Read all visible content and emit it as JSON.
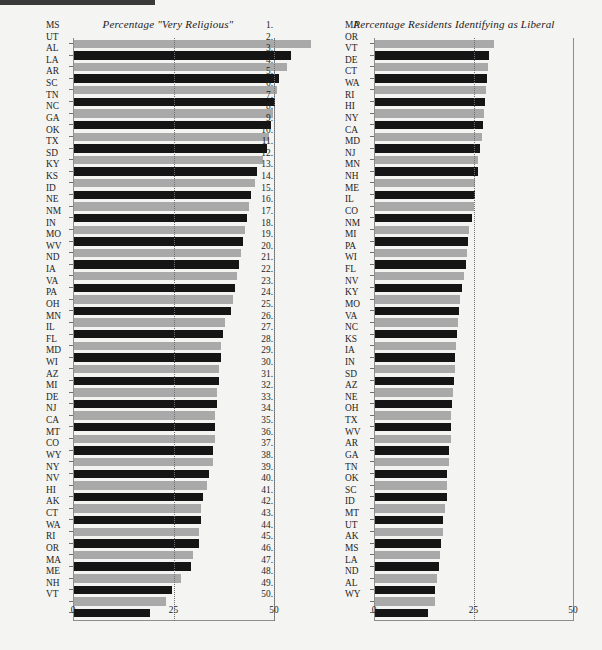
{
  "chart_data": [
    {
      "type": "bar",
      "orientation": "horizontal",
      "title": "Percentage \"Very Religious\"",
      "xlabel": "",
      "ylabel": "",
      "xlim": [
        0,
        50
      ],
      "xticks": [
        0,
        25,
        50
      ],
      "xtick_labels": [
        "0",
        "25",
        "50"
      ],
      "grid": true,
      "gridlines_at": [
        25,
        50
      ],
      "legend": "none",
      "bar_colors": {
        "odd_rank": "#a9a9a9",
        "even_rank": "#151515"
      },
      "categories": [
        "MS",
        "UT",
        "AL",
        "LA",
        "AR",
        "SC",
        "TN",
        "NC",
        "GA",
        "OK",
        "TX",
        "SD",
        "KY",
        "KS",
        "ID",
        "NE",
        "NM",
        "IN",
        "MO",
        "WV",
        "ND",
        "IA",
        "VA",
        "PA",
        "OH",
        "MN",
        "IL",
        "FL",
        "MD",
        "WI",
        "AZ",
        "MI",
        "DE",
        "NJ",
        "CA",
        "MT",
        "CO",
        "WY",
        "NY",
        "NV",
        "HI",
        "AK",
        "CT",
        "WA",
        "RI",
        "OR",
        "MA",
        "ME",
        "NH",
        "VT"
      ],
      "values": [
        59,
        54,
        53,
        51,
        50.5,
        50,
        49.5,
        49,
        48.5,
        48,
        47,
        45.5,
        45,
        44,
        43.5,
        43,
        42.5,
        42,
        41.5,
        41,
        40.5,
        40,
        39.5,
        39,
        37.5,
        37,
        36.5,
        36.5,
        36,
        36,
        35.5,
        35.5,
        35,
        35,
        35,
        34.5,
        34.5,
        33.5,
        33,
        32,
        31.5,
        31.5,
        31,
        31,
        29.5,
        29,
        26.5,
        24.5,
        23,
        19
      ],
      "ranks": [
        1,
        2,
        3,
        4,
        5,
        6,
        7,
        8,
        9,
        10,
        11,
        12,
        13,
        14,
        15,
        16,
        17,
        18,
        19,
        20,
        21,
        22,
        23,
        24,
        25,
        26,
        27,
        28,
        29,
        30,
        31,
        32,
        33,
        34,
        35,
        36,
        37,
        38,
        39,
        40,
        41,
        42,
        43,
        44,
        45,
        46,
        47,
        48,
        49,
        50
      ]
    },
    {
      "type": "bar",
      "orientation": "horizontal",
      "title": "Percentage Residents Identifying as Liberal",
      "xlabel": "",
      "ylabel": "",
      "xlim": [
        0,
        50
      ],
      "xticks": [
        0,
        25,
        50
      ],
      "xtick_labels": [
        "0",
        "25",
        "50"
      ],
      "grid": true,
      "gridlines_at": [
        25
      ],
      "legend": "none",
      "bar_colors": {
        "odd_rank": "#a9a9a9",
        "even_rank": "#151515"
      },
      "categories": [
        "MA",
        "OR",
        "VT",
        "DE",
        "CT",
        "WA",
        "RI",
        "HI",
        "NY",
        "CA",
        "MD",
        "NJ",
        "MN",
        "NH",
        "ME",
        "IL",
        "CO",
        "NM",
        "MI",
        "PA",
        "WI",
        "FL",
        "NV",
        "KY",
        "MO",
        "VA",
        "NC",
        "KS",
        "IA",
        "IN",
        "SD",
        "AZ",
        "NE",
        "OH",
        "TX",
        "WV",
        "AR",
        "GA",
        "TN",
        "OK",
        "SC",
        "ID",
        "MT",
        "UT",
        "AK",
        "MS",
        "LA",
        "ND",
        "AL",
        "WY"
      ],
      "values": [
        30,
        28.6,
        28.4,
        28.2,
        28,
        27.6,
        27.4,
        27.2,
        26.8,
        26.4,
        26,
        25.8,
        25.2,
        25,
        24.8,
        24.4,
        23.6,
        23.4,
        23,
        22.8,
        22.4,
        21.8,
        21.4,
        21.2,
        20.8,
        20.6,
        20.4,
        20.2,
        20,
        19.8,
        19.6,
        19.4,
        19.2,
        19.2,
        19,
        18.6,
        18.6,
        18.2,
        18.2,
        18,
        17.6,
        17.2,
        17.2,
        16.6,
        16.4,
        16,
        15.6,
        15.2,
        15,
        13.2
      ],
      "ranks": [
        1,
        2,
        3,
        4,
        5,
        6,
        7,
        8,
        9,
        10,
        11,
        12,
        13,
        14,
        15,
        16,
        17,
        18,
        19,
        20,
        21,
        22,
        23,
        24,
        25,
        26,
        27,
        28,
        29,
        30,
        31,
        32,
        33,
        34,
        35,
        36,
        37,
        38,
        39,
        40,
        41,
        42,
        43,
        44,
        45,
        46,
        47,
        48,
        49,
        50
      ]
    }
  ]
}
